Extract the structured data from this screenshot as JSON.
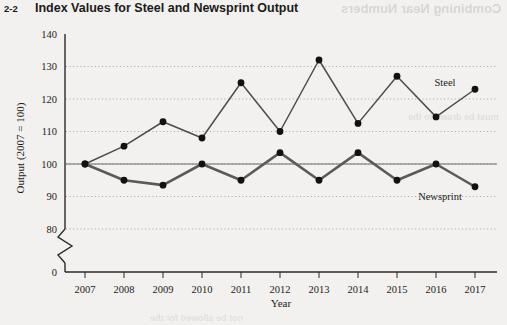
{
  "figure": {
    "number": "2-2",
    "title": "Index Values for Steel and Newsprint Output"
  },
  "ghost_text": {
    "top": "Combining Near Numbers",
    "middle": "must be drawn to the",
    "bottom": "not be allowed for the"
  },
  "chart_data": {
    "type": "line",
    "title": "Index Values for Steel and Newsprint Output",
    "xlabel": "Year",
    "ylabel": "Output (2007 = 100)",
    "categories": [
      "2007",
      "2008",
      "2009",
      "2010",
      "2011",
      "2012",
      "2013",
      "2014",
      "2015",
      "2016",
      "2017"
    ],
    "x": [
      2007,
      2008,
      2009,
      2010,
      2011,
      2012,
      2013,
      2014,
      2015,
      2016,
      2017
    ],
    "series": [
      {
        "name": "Steel",
        "values": [
          100,
          105.5,
          113,
          108,
          125,
          110,
          132,
          112.5,
          127,
          114.5,
          123
        ]
      },
      {
        "name": "Newsprint",
        "values": [
          100,
          95,
          93.5,
          100,
          95,
          103.5,
          95,
          103.5,
          95,
          100,
          93
        ]
      }
    ],
    "ylim": [
      80,
      140
    ],
    "yticks": [
      80,
      90,
      100,
      110,
      120,
      130,
      140
    ],
    "y_axis_break": true,
    "y_axis_zero_label": "0",
    "grid": true,
    "grid_style": "dotted-horizontal",
    "legend_position": "inline-right",
    "reference_line": 100,
    "marker": "filled-circle"
  },
  "colors": {
    "ink": "#1b1b1b",
    "steel_line": "#4d4d4d",
    "newsprint_line": "#5a5a5a",
    "grid": "#9a9a9a",
    "page_background": "#f2f1ef"
  }
}
